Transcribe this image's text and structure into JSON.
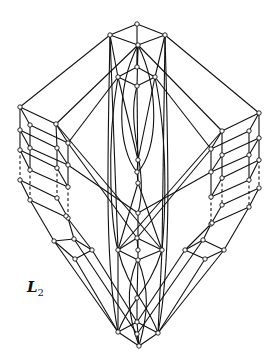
{
  "figure": {
    "label_main": "L",
    "label_subscript": "2",
    "label_full": "L₂",
    "colors": {
      "line": "#111111",
      "background": "#ffffff",
      "node_fill": "#ffffff"
    }
  },
  "nodes": [
    {
      "id": "t0",
      "x": 137,
      "y": 24
    },
    {
      "id": "t1",
      "x": 110,
      "y": 35
    },
    {
      "id": "t2",
      "x": 165,
      "y": 35
    },
    {
      "id": "t3",
      "x": 138,
      "y": 45
    },
    {
      "id": "t4",
      "x": 137,
      "y": 67
    },
    {
      "id": "t5",
      "x": 118,
      "y": 77
    },
    {
      "id": "t6",
      "x": 155,
      "y": 77
    },
    {
      "id": "t7",
      "x": 137,
      "y": 86
    },
    {
      "id": "L0",
      "x": 20,
      "y": 107
    },
    {
      "id": "L1",
      "x": 30,
      "y": 125
    },
    {
      "id": "L2",
      "x": 56,
      "y": 124
    },
    {
      "id": "L3",
      "x": 68,
      "y": 143
    },
    {
      "id": "L4",
      "x": 20,
      "y": 130
    },
    {
      "id": "L5",
      "x": 30,
      "y": 148
    },
    {
      "id": "L6",
      "x": 57,
      "y": 148
    },
    {
      "id": "L7",
      "x": 68,
      "y": 165
    },
    {
      "id": "L8",
      "x": 20,
      "y": 150
    },
    {
      "id": "L9",
      "x": 30,
      "y": 170
    },
    {
      "id": "L10",
      "x": 57,
      "y": 168
    },
    {
      "id": "L11",
      "x": 68,
      "y": 187
    },
    {
      "id": "L12",
      "x": 20,
      "y": 180
    },
    {
      "id": "L13",
      "x": 30,
      "y": 200
    },
    {
      "id": "L14",
      "x": 57,
      "y": 198
    },
    {
      "id": "L15",
      "x": 68,
      "y": 218
    },
    {
      "id": "R0",
      "x": 259,
      "y": 113
    },
    {
      "id": "R1",
      "x": 249,
      "y": 131
    },
    {
      "id": "R2",
      "x": 222,
      "y": 131
    },
    {
      "id": "R3",
      "x": 211,
      "y": 149
    },
    {
      "id": "R4",
      "x": 259,
      "y": 138
    },
    {
      "id": "R5",
      "x": 249,
      "y": 155
    },
    {
      "id": "R6",
      "x": 222,
      "y": 155
    },
    {
      "id": "R7",
      "x": 211,
      "y": 172
    },
    {
      "id": "R8",
      "x": 259,
      "y": 160
    },
    {
      "id": "R9",
      "x": 249,
      "y": 180
    },
    {
      "id": "R10",
      "x": 222,
      "y": 178
    },
    {
      "id": "R11",
      "x": 211,
      "y": 197
    },
    {
      "id": "R12",
      "x": 259,
      "y": 188
    },
    {
      "id": "R13",
      "x": 249,
      "y": 207
    },
    {
      "id": "R14",
      "x": 222,
      "y": 205
    },
    {
      "id": "R15",
      "x": 211,
      "y": 224
    },
    {
      "id": "c0",
      "x": 138,
      "y": 160
    },
    {
      "id": "c1",
      "x": 137,
      "y": 172
    },
    {
      "id": "c2",
      "x": 138,
      "y": 183
    },
    {
      "id": "c3",
      "x": 138,
      "y": 213
    },
    {
      "id": "ml0",
      "x": 54,
      "y": 241
    },
    {
      "id": "ml1",
      "x": 74,
      "y": 239
    },
    {
      "id": "ml2",
      "x": 92,
      "y": 250
    },
    {
      "id": "ml3",
      "x": 75,
      "y": 259
    },
    {
      "id": "ml4",
      "x": 66,
      "y": 216
    },
    {
      "id": "mc0",
      "x": 118,
      "y": 250
    },
    {
      "id": "mc1",
      "x": 137,
      "y": 238
    },
    {
      "id": "mc2",
      "x": 138,
      "y": 250
    },
    {
      "id": "mc3",
      "x": 162,
      "y": 250
    },
    {
      "id": "mc4",
      "x": 138,
      "y": 260
    },
    {
      "id": "mr0",
      "x": 185,
      "y": 250
    },
    {
      "id": "mr1",
      "x": 203,
      "y": 240
    },
    {
      "id": "mr2",
      "x": 224,
      "y": 250
    },
    {
      "id": "mr3",
      "x": 205,
      "y": 259
    },
    {
      "id": "mr4",
      "x": 212,
      "y": 223
    },
    {
      "id": "b0",
      "x": 137,
      "y": 298
    },
    {
      "id": "b1",
      "x": 118,
      "y": 332
    },
    {
      "id": "b2",
      "x": 137,
      "y": 322
    },
    {
      "id": "b3",
      "x": 137,
      "y": 334
    },
    {
      "id": "b4",
      "x": 158,
      "y": 333
    },
    {
      "id": "b5",
      "x": 139,
      "y": 346
    }
  ],
  "edges": [
    [
      "t0",
      "t1"
    ],
    [
      "t0",
      "t2"
    ],
    [
      "t1",
      "t3"
    ],
    [
      "t2",
      "t3"
    ],
    [
      "t1",
      "t5"
    ],
    [
      "t2",
      "t6"
    ],
    [
      "t0",
      "t4"
    ],
    [
      "t3",
      "t4"
    ],
    [
      "t4",
      "t5"
    ],
    [
      "t4",
      "t6"
    ],
    [
      "t5",
      "t7"
    ],
    [
      "t6",
      "t7"
    ],
    [
      "t3",
      "t7"
    ],
    [
      "t1",
      "L0"
    ],
    [
      "t2",
      "R0"
    ],
    [
      "t3",
      "L2"
    ],
    [
      "t3",
      "R2"
    ],
    [
      "t5",
      "L3"
    ],
    [
      "t6",
      "R3"
    ],
    [
      "L0",
      "L1"
    ],
    [
      "L0",
      "L2"
    ],
    [
      "L1",
      "L3"
    ],
    [
      "L2",
      "L3"
    ],
    [
      "L0",
      "L4"
    ],
    [
      "L1",
      "L5"
    ],
    [
      "L2",
      "L6"
    ],
    [
      "L3",
      "L7"
    ],
    [
      "L4",
      "L5"
    ],
    [
      "L4",
      "L6"
    ],
    [
      "L5",
      "L7"
    ],
    [
      "L6",
      "L7"
    ],
    [
      "L4",
      "L8"
    ],
    [
      "L5",
      "L9"
    ],
    [
      "L6",
      "L10"
    ],
    [
      "L7",
      "L11"
    ],
    [
      "L8",
      "L9"
    ],
    [
      "L8",
      "L10"
    ],
    [
      "L9",
      "L11"
    ],
    [
      "L10",
      "L11"
    ],
    [
      "L12",
      "L13"
    ],
    [
      "L12",
      "L14"
    ],
    [
      "L13",
      "L15"
    ],
    [
      "L14",
      "L15"
    ],
    [
      "R0",
      "R1"
    ],
    [
      "R0",
      "R2"
    ],
    [
      "R1",
      "R3"
    ],
    [
      "R2",
      "R3"
    ],
    [
      "R0",
      "R4"
    ],
    [
      "R1",
      "R5"
    ],
    [
      "R2",
      "R6"
    ],
    [
      "R3",
      "R7"
    ],
    [
      "R4",
      "R5"
    ],
    [
      "R4",
      "R6"
    ],
    [
      "R5",
      "R7"
    ],
    [
      "R6",
      "R7"
    ],
    [
      "R4",
      "R8"
    ],
    [
      "R5",
      "R9"
    ],
    [
      "R6",
      "R10"
    ],
    [
      "R7",
      "R11"
    ],
    [
      "R8",
      "R9"
    ],
    [
      "R8",
      "R10"
    ],
    [
      "R9",
      "R11"
    ],
    [
      "R10",
      "R11"
    ],
    [
      "R12",
      "R13"
    ],
    [
      "R12",
      "R14"
    ],
    [
      "R13",
      "R15"
    ],
    [
      "R14",
      "R15"
    ],
    [
      "L3",
      "mc1"
    ],
    [
      "R3",
      "mc1"
    ],
    [
      "L7",
      "c3"
    ],
    [
      "R7",
      "c3"
    ],
    [
      "L2",
      "mc3"
    ],
    [
      "R2",
      "mc0"
    ],
    [
      "t1",
      "mc0"
    ],
    [
      "t2",
      "mc3"
    ],
    [
      "t5",
      "c0"
    ],
    [
      "t6",
      "c0"
    ],
    [
      "c0",
      "c1"
    ],
    [
      "c1",
      "c2"
    ],
    [
      "t7",
      "c2"
    ],
    [
      "c2",
      "mc0"
    ],
    [
      "c2",
      "mc3"
    ],
    [
      "c3",
      "mc2"
    ],
    [
      "L15",
      "ml1"
    ],
    [
      "L13",
      "ml0"
    ],
    [
      "ml0",
      "ml1"
    ],
    [
      "ml0",
      "ml3"
    ],
    [
      "ml1",
      "ml2"
    ],
    [
      "ml3",
      "ml2"
    ],
    [
      "ml4",
      "ml2"
    ],
    [
      "R15",
      "mr1"
    ],
    [
      "R13",
      "mr2"
    ],
    [
      "mr0",
      "mr1"
    ],
    [
      "mr1",
      "mr2"
    ],
    [
      "mr0",
      "mr3"
    ],
    [
      "mr3",
      "mr2"
    ],
    [
      "mr4",
      "mr0"
    ],
    [
      "mc0",
      "mc1"
    ],
    [
      "mc1",
      "mc3"
    ],
    [
      "mc0",
      "mc4"
    ],
    [
      "mc3",
      "mc4"
    ],
    [
      "mc1",
      "mc2"
    ],
    [
      "mc2",
      "mc4"
    ],
    [
      "ml0",
      "b1"
    ],
    [
      "ml3",
      "b1"
    ],
    [
      "ml2",
      "b2"
    ],
    [
      "ml1",
      "b3"
    ],
    [
      "mr2",
      "b4"
    ],
    [
      "mr3",
      "b4"
    ],
    [
      "mr0",
      "b2"
    ],
    [
      "mr1",
      "b3"
    ],
    [
      "mc0",
      "b1"
    ],
    [
      "mc3",
      "b4"
    ],
    [
      "mc4",
      "b0"
    ],
    [
      "b0",
      "b2"
    ],
    [
      "b1",
      "b5"
    ],
    [
      "b2",
      "b5"
    ],
    [
      "b3",
      "b5"
    ],
    [
      "b4",
      "b5"
    ],
    [
      "b1",
      "b2"
    ],
    [
      "b2",
      "b4"
    ]
  ],
  "dashed_edges": [
    [
      "L8",
      "L12"
    ],
    [
      "L9",
      "L13"
    ],
    [
      "L10",
      "L14"
    ],
    [
      "L11",
      "L15"
    ],
    [
      "R8",
      "R12"
    ],
    [
      "R9",
      "R13"
    ],
    [
      "R10",
      "R14"
    ],
    [
      "R11",
      "R15"
    ]
  ],
  "curves": [
    "M118 77 C 105 150, 112 230, 118 250",
    "M155 77 C 170 150, 164 230, 162 250",
    "M137 86 C 125 130, 150 170, 138 213",
    "M138 45 C 115 90, 118 150, 137 172",
    "M138 45 C 160 90, 158 150, 138 172",
    "M118 250 C 128 290, 146 300, 158 333",
    "M162 250 C 150 290, 130 300, 118 332",
    "M137 260 C 125 290, 128 315, 139 346",
    "M138 260 C 150 290, 148 315, 139 346",
    "M110 35 C 108 150, 104 260, 118 332",
    "M165 35 C 168 150, 172 260, 158 333"
  ]
}
